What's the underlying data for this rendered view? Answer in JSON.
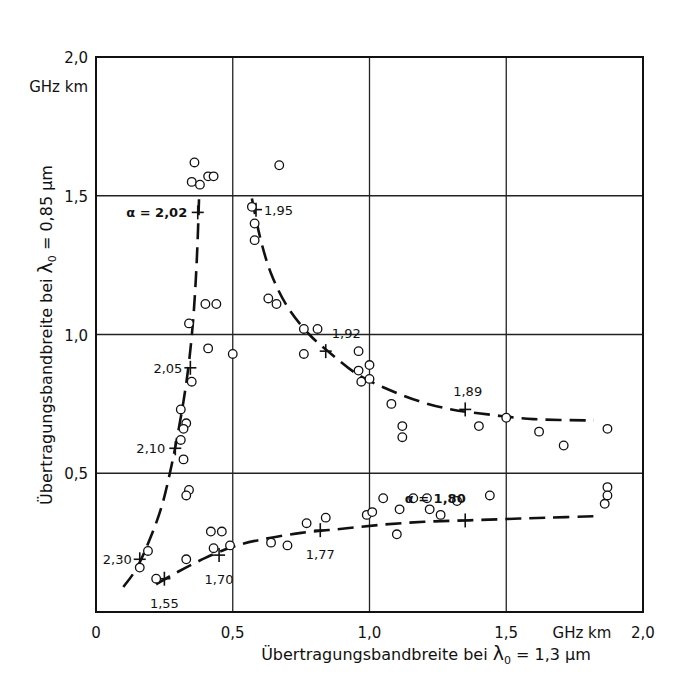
{
  "chart_data": {
    "type": "scatter",
    "title": "",
    "xlabel": "Übertragungsbandbreite bei λ0 = 1,3 µm",
    "ylabel": "Übertragungsbandbreite bei λ0 = 0,85 µm",
    "xlabel_parts": {
      "text": "Übertragungsbandbreite bei ",
      "symbol": "λ",
      "sub": "0",
      "rest": " = 1,3 µm"
    },
    "ylabel_parts": {
      "text": "Übertragungsbandbreite bei ",
      "symbol": "λ",
      "sub": "0",
      "rest": " = 0,85 µm"
    },
    "xlim": [
      0,
      2.0
    ],
    "ylim": [
      0,
      2.0
    ],
    "x_unit": "GHz km",
    "y_unit": "GHz km",
    "x_ticks": [
      {
        "v": 0,
        "label": "0"
      },
      {
        "v": 0.5,
        "label": "0,5"
      },
      {
        "v": 1.0,
        "label": "1,0"
      },
      {
        "v": 1.5,
        "label": "1,5"
      },
      {
        "v": 2.0,
        "label": "2,0"
      }
    ],
    "y_ticks": [
      {
        "v": 0.5,
        "label": "0,5"
      },
      {
        "v": 1.0,
        "label": "1,0"
      },
      {
        "v": 1.5,
        "label": "1,5"
      },
      {
        "v": 2.0,
        "label": "2,0"
      }
    ],
    "grid": true,
    "grid_x": [
      0.5,
      1.0,
      1.5
    ],
    "grid_y": [
      0.5,
      1.0,
      1.5
    ],
    "series": [
      {
        "name": "measured fibers",
        "marker": "open-circle",
        "points": [
          [
            0.36,
            1.62
          ],
          [
            0.35,
            1.55
          ],
          [
            0.38,
            1.54
          ],
          [
            0.41,
            1.57
          ],
          [
            0.43,
            1.57
          ],
          [
            0.67,
            1.61
          ],
          [
            0.57,
            1.46
          ],
          [
            0.58,
            1.4
          ],
          [
            0.58,
            1.34
          ],
          [
            0.63,
            1.13
          ],
          [
            0.66,
            1.11
          ],
          [
            0.4,
            1.11
          ],
          [
            0.44,
            1.11
          ],
          [
            0.41,
            0.95
          ],
          [
            0.5,
            0.93
          ],
          [
            0.34,
            1.04
          ],
          [
            0.35,
            0.83
          ],
          [
            0.31,
            0.73
          ],
          [
            0.33,
            0.68
          ],
          [
            0.32,
            0.66
          ],
          [
            0.31,
            0.62
          ],
          [
            0.32,
            0.55
          ],
          [
            0.34,
            0.44
          ],
          [
            0.33,
            0.42
          ],
          [
            0.76,
            1.02
          ],
          [
            0.81,
            1.02
          ],
          [
            0.76,
            0.93
          ],
          [
            0.96,
            0.94
          ],
          [
            1.0,
            0.89
          ],
          [
            0.96,
            0.87
          ],
          [
            0.97,
            0.83
          ],
          [
            1.0,
            0.84
          ],
          [
            1.08,
            0.75
          ],
          [
            1.12,
            0.67
          ],
          [
            1.12,
            0.63
          ],
          [
            1.4,
            0.67
          ],
          [
            1.5,
            0.7
          ],
          [
            1.62,
            0.65
          ],
          [
            1.71,
            0.6
          ],
          [
            1.87,
            0.66
          ],
          [
            0.16,
            0.16
          ],
          [
            0.19,
            0.22
          ],
          [
            0.22,
            0.12
          ],
          [
            0.33,
            0.19
          ],
          [
            0.42,
            0.29
          ],
          [
            0.46,
            0.29
          ],
          [
            0.43,
            0.23
          ],
          [
            0.49,
            0.24
          ],
          [
            0.64,
            0.25
          ],
          [
            0.7,
            0.24
          ],
          [
            0.77,
            0.32
          ],
          [
            0.84,
            0.34
          ],
          [
            0.99,
            0.35
          ],
          [
            1.01,
            0.36
          ],
          [
            1.05,
            0.41
          ],
          [
            1.1,
            0.28
          ],
          [
            1.11,
            0.37
          ],
          [
            1.16,
            0.41
          ],
          [
            1.21,
            0.41
          ],
          [
            1.22,
            0.37
          ],
          [
            1.26,
            0.35
          ],
          [
            1.32,
            0.4
          ],
          [
            1.44,
            0.42
          ],
          [
            1.87,
            0.45
          ],
          [
            1.87,
            0.42
          ],
          [
            1.86,
            0.39
          ]
        ]
      }
    ],
    "curves": [
      {
        "name": "left curve (alpha 2.30 → 2.02)",
        "style": "dashed",
        "points": [
          [
            0.1,
            0.09
          ],
          [
            0.15,
            0.16
          ],
          [
            0.2,
            0.27
          ],
          [
            0.24,
            0.38
          ],
          [
            0.27,
            0.5
          ],
          [
            0.295,
            0.62
          ],
          [
            0.32,
            0.76
          ],
          [
            0.34,
            0.9
          ],
          [
            0.355,
            1.05
          ],
          [
            0.365,
            1.2
          ],
          [
            0.372,
            1.35
          ],
          [
            0.377,
            1.5
          ]
        ],
        "labels": [
          {
            "text": "α = 2,02",
            "at": [
              0.37,
              1.44
            ],
            "anchor": "end",
            "dx": -10
          },
          {
            "text": "2,05",
            "at": [
              0.345,
              0.88
            ],
            "anchor": "end",
            "dx": -8
          },
          {
            "text": "2,10",
            "at": [
              0.29,
              0.59
            ],
            "anchor": "end",
            "dx": -10
          },
          {
            "text": "2,30",
            "at": [
              0.16,
              0.19
            ],
            "anchor": "end",
            "dx": -8
          }
        ]
      },
      {
        "name": "upper right curve (alpha 1.95 → 1.89)",
        "style": "dashed",
        "points": [
          [
            0.57,
            1.49
          ],
          [
            0.6,
            1.35
          ],
          [
            0.64,
            1.22
          ],
          [
            0.7,
            1.1
          ],
          [
            0.78,
            1.0
          ],
          [
            0.86,
            0.93
          ],
          [
            0.95,
            0.86
          ],
          [
            1.05,
            0.81
          ],
          [
            1.18,
            0.76
          ],
          [
            1.3,
            0.73
          ],
          [
            1.45,
            0.71
          ],
          [
            1.6,
            0.695
          ],
          [
            1.82,
            0.69
          ]
        ],
        "labels": [
          {
            "text": "1,95",
            "at": [
              0.585,
              1.45
            ],
            "anchor": "start",
            "dx": 8
          },
          {
            "text": "1,92",
            "at": [
              0.84,
              0.94
            ],
            "anchor": "start",
            "dx": 6,
            "dy": -18
          },
          {
            "text": "1,89",
            "at": [
              1.35,
              0.73
            ],
            "anchor": "start",
            "dx": -12,
            "dy": -18
          }
        ]
      },
      {
        "name": "lower curve (alpha 1.55 → 1.80)",
        "style": "dashed",
        "points": [
          [
            0.22,
            0.1
          ],
          [
            0.3,
            0.145
          ],
          [
            0.4,
            0.195
          ],
          [
            0.5,
            0.235
          ],
          [
            0.6,
            0.26
          ],
          [
            0.75,
            0.285
          ],
          [
            0.9,
            0.3
          ],
          [
            1.05,
            0.315
          ],
          [
            1.2,
            0.325
          ],
          [
            1.35,
            0.33
          ],
          [
            1.5,
            0.335
          ],
          [
            1.65,
            0.34
          ],
          [
            1.82,
            0.345
          ]
        ],
        "labels": [
          {
            "text": "1,55",
            "at": [
              0.25,
              0.12
            ],
            "anchor": "middle",
            "dy": 24
          },
          {
            "text": "1,70",
            "at": [
              0.45,
              0.205
            ],
            "anchor": "middle",
            "dy": 24
          },
          {
            "text": "1,77",
            "at": [
              0.82,
              0.295
            ],
            "anchor": "middle",
            "dy": 24
          },
          {
            "text": "α = 1,80",
            "at": [
              1.35,
              0.33
            ],
            "anchor": "middle",
            "dy": -22,
            "dx": -30
          }
        ]
      }
    ],
    "alpha_ticks": [
      [
        0.372,
        1.44
      ],
      [
        0.345,
        0.88
      ],
      [
        0.29,
        0.59
      ],
      [
        0.16,
        0.19
      ],
      [
        0.585,
        1.45
      ],
      [
        0.84,
        0.94
      ],
      [
        1.35,
        0.73
      ],
      [
        0.25,
        0.12
      ],
      [
        0.45,
        0.205
      ],
      [
        0.82,
        0.295
      ],
      [
        1.35,
        0.33
      ]
    ]
  }
}
